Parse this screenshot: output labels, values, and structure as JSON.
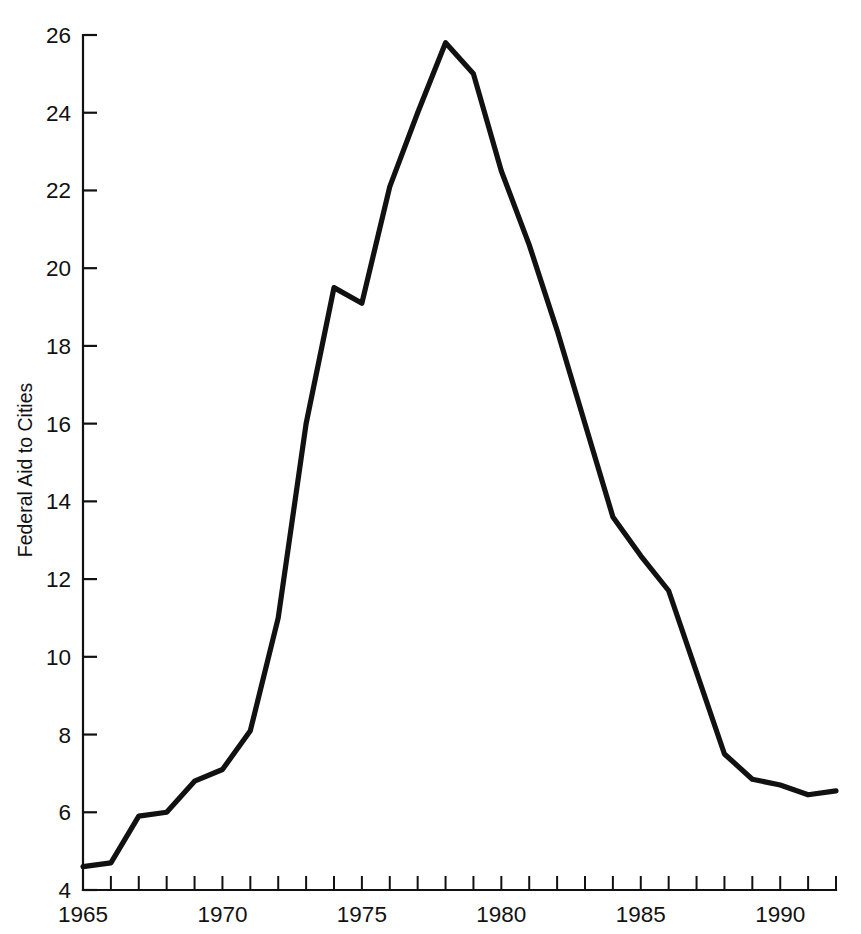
{
  "chart_data": {
    "type": "line",
    "title": "",
    "subtitle": "",
    "xlabel": "",
    "ylabel": "Federal Aid to Cities",
    "xlim": [
      1965,
      1992
    ],
    "ylim": [
      4,
      26
    ],
    "grid": false,
    "legend": null,
    "legend_position": "none",
    "y_ticks": [
      4,
      6,
      8,
      10,
      12,
      14,
      16,
      18,
      20,
      22,
      24,
      26
    ],
    "y_tick_labels": [
      "4",
      "6",
      "8",
      "10",
      "12",
      "14",
      "16",
      "18",
      "20",
      "22",
      "24",
      "26"
    ],
    "x_ticks": [
      1965,
      1966,
      1967,
      1968,
      1969,
      1970,
      1971,
      1972,
      1973,
      1974,
      1975,
      1976,
      1977,
      1978,
      1979,
      1980,
      1981,
      1982,
      1983,
      1984,
      1985,
      1986,
      1987,
      1988,
      1989,
      1990,
      1991,
      1992
    ],
    "x_tick_labels": [
      "1965",
      "1970",
      "1975",
      "1980",
      "1985",
      "1990"
    ],
    "x_labeled_ticks": [
      1965,
      1970,
      1975,
      1980,
      1985,
      1990
    ],
    "line_color": "#111111",
    "background_color": "#ffffff",
    "x": [
      1965,
      1966,
      1967,
      1968,
      1969,
      1970,
      1971,
      1972,
      1973,
      1974,
      1975,
      1976,
      1977,
      1978,
      1979,
      1980,
      1981,
      1982,
      1983,
      1984,
      1985,
      1986,
      1987,
      1988,
      1989,
      1990,
      1991,
      1992
    ],
    "values": [
      4.6,
      4.7,
      5.9,
      6.0,
      6.8,
      7.1,
      8.1,
      11.0,
      16.0,
      19.5,
      19.1,
      22.1,
      24.0,
      25.8,
      25.0,
      22.5,
      20.6,
      18.4,
      16.0,
      13.6,
      12.6,
      11.7,
      9.6,
      7.5,
      6.85,
      6.7,
      6.45,
      6.55
    ],
    "series": [
      {
        "name": "Federal Aid to Cities",
        "values": [
          4.6,
          4.7,
          5.9,
          6.0,
          6.8,
          7.1,
          8.1,
          11.0,
          16.0,
          19.5,
          19.1,
          22.1,
          24.0,
          25.8,
          25.0,
          22.5,
          20.6,
          18.4,
          16.0,
          13.6,
          12.6,
          11.7,
          9.6,
          7.5,
          6.85,
          6.7,
          6.45,
          6.55
        ]
      }
    ],
    "annotations": []
  },
  "axes": {
    "y_axis_title": "Federal Aid to Cities"
  }
}
